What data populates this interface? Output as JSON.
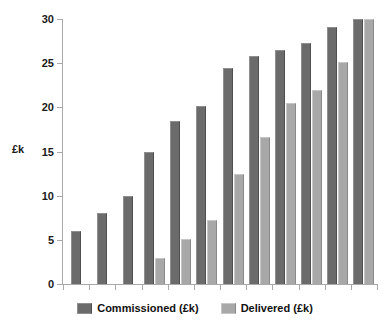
{
  "chart_data": {
    "type": "bar",
    "title": "",
    "subtitle": "",
    "xlabel": "",
    "ylabel": "£k",
    "ylim": [
      0,
      30
    ],
    "yticks": [
      0,
      5,
      10,
      15,
      20,
      25,
      30
    ],
    "ytick_labels": [
      "0",
      "5",
      "10",
      "15",
      "20",
      "25",
      "30"
    ],
    "grid": false,
    "legend_position": "bottom-center",
    "orientation": "vertical",
    "grouping": "clustered",
    "categories": [
      "1",
      "2",
      "3",
      "4",
      "5",
      "6",
      "7",
      "8",
      "9",
      "10",
      "11",
      "12"
    ],
    "xtick_labels": [
      "",
      "",
      "",
      "",
      "",
      "",
      "",
      "",
      "",
      "",
      "",
      ""
    ],
    "series": [
      {
        "name": "Commissioned (£k)",
        "color": "#6b6b6b",
        "values": [
          6,
          8,
          10,
          15,
          18.4,
          20.1,
          24.4,
          25.8,
          26.5,
          27.3,
          29.1,
          30
        ]
      },
      {
        "name": "Delivered (£k)",
        "color": "#a8a8a8",
        "values": [
          null,
          null,
          null,
          3,
          5.1,
          7.3,
          12.5,
          16.6,
          20.5,
          22,
          25.1,
          30
        ]
      }
    ]
  },
  "legend": {
    "items": [
      {
        "label": "Commissioned (£k)",
        "swatch": "dark-gray-swatch"
      },
      {
        "label": "Delivered (£k)",
        "swatch": "light-gray-swatch"
      }
    ]
  },
  "axes": {
    "y_axis_title": "£k"
  },
  "colors": {
    "series_commissioned": "#6b6b6b",
    "series_delivered": "#a8a8a8",
    "axis": "#a9a9a9",
    "text": "#111111",
    "background": "#ffffff"
  }
}
